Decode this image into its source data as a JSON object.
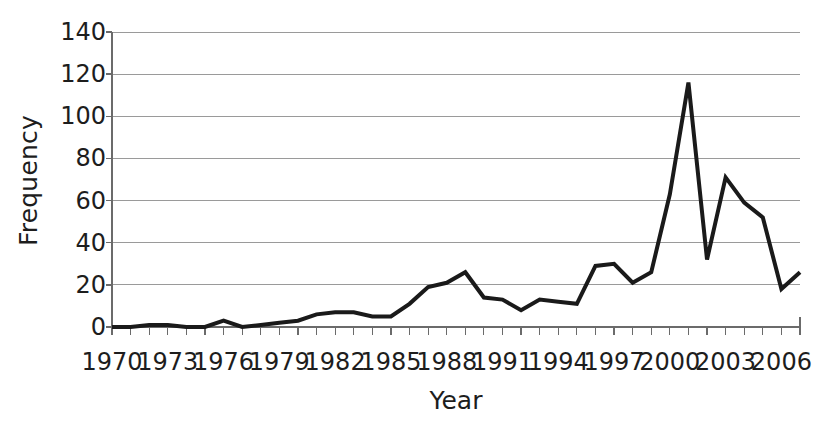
{
  "chart_data": {
    "type": "line",
    "title": "",
    "subtitle": "",
    "xlabel": "Year",
    "ylabel": "Frequency",
    "xlim": [
      1970,
      2007
    ],
    "ylim": [
      0,
      140
    ],
    "ytick_step": 20,
    "xtick_step": 3,
    "grid": "horizontal",
    "legend": "none",
    "line_color": "#1a1a1a",
    "line_width": 4,
    "grid_color": "#9a9a9a",
    "axis_color": "#6b6b6b",
    "background": "#ffffff",
    "y_ticks": [
      0,
      20,
      40,
      60,
      80,
      100,
      120,
      140
    ],
    "y_tick_labels": [
      "0",
      "20",
      "40",
      "60",
      "80",
      "100",
      "120",
      "140"
    ],
    "x_ticks": [
      1970,
      1973,
      1976,
      1979,
      1982,
      1985,
      1988,
      1991,
      1994,
      1997,
      2000,
      2003,
      2006
    ],
    "x_tick_labels": [
      "1970",
      "1973",
      "1976",
      "1979",
      "1982",
      "1985",
      "1988",
      "1991",
      "1994",
      "1997",
      "2000",
      "2003",
      "2006"
    ],
    "x": [
      1970,
      1971,
      1972,
      1973,
      1974,
      1975,
      1976,
      1977,
      1978,
      1979,
      1980,
      1981,
      1982,
      1983,
      1984,
      1985,
      1986,
      1987,
      1988,
      1989,
      1990,
      1991,
      1992,
      1993,
      1994,
      1995,
      1996,
      1997,
      1998,
      1999,
      2000,
      2001,
      2002,
      2003,
      2004,
      2005,
      2006,
      2007
    ],
    "values": [
      0,
      0,
      1,
      1,
      0,
      0,
      3,
      0,
      1,
      2,
      3,
      6,
      7,
      7,
      5,
      5,
      11,
      19,
      21,
      26,
      14,
      13,
      8,
      13,
      12,
      11,
      29,
      30,
      21,
      26,
      63,
      116,
      32,
      71,
      59,
      52,
      18,
      26
    ],
    "series": [
      {
        "name": "Frequency",
        "values": [
          0,
          0,
          1,
          1,
          0,
          0,
          3,
          0,
          1,
          2,
          3,
          6,
          7,
          7,
          5,
          5,
          11,
          19,
          21,
          26,
          14,
          13,
          8,
          13,
          12,
          11,
          29,
          30,
          21,
          26,
          63,
          116,
          32,
          71,
          59,
          52,
          18,
          26
        ]
      }
    ],
    "annotations": {
      "peak_year": 2001,
      "peak_value": 116
    }
  }
}
